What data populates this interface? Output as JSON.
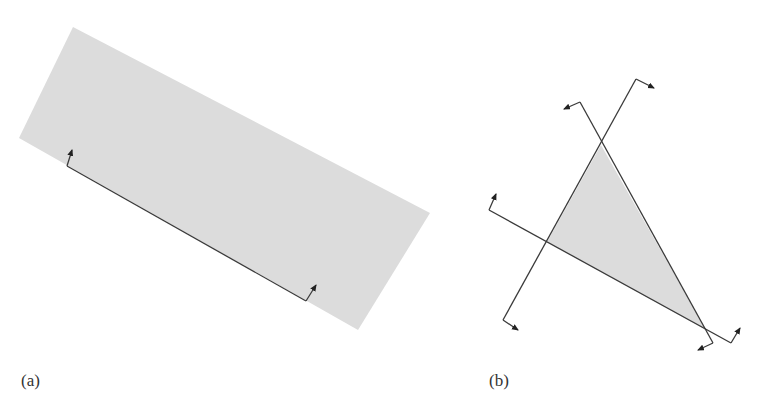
{
  "figure": {
    "panels": [
      {
        "id": "a",
        "label": "(a)",
        "description": "Gray half-plane strip (rotated rectangle) with a boundary line segment and two normal arrows pointing into the shaded region",
        "shaded_region": {
          "shape": "parallelogram",
          "fill": "#dcdcdc",
          "vertices": [
            [
              73,
              27
            ],
            [
              430,
              213
            ],
            [
              358,
              330
            ],
            [
              19,
              138
            ]
          ]
        },
        "boundary_line": {
          "from": [
            67,
            166
          ],
          "to": [
            306,
            301
          ],
          "stroke": "#333333"
        },
        "arrows": [
          {
            "from": [
              67,
              166
            ],
            "to": [
              72,
              150
            ]
          },
          {
            "from": [
              306,
              301
            ],
            "to": [
              316,
              285
            ]
          }
        ]
      },
      {
        "id": "b",
        "label": "(b)",
        "description": "Triangle formed by intersection of three half-planes; each boundary line has normal arrows at both ends",
        "shaded_region": {
          "shape": "triangle",
          "fill": "#dcdcdc",
          "vertices": [
            [
              601,
              145
            ],
            [
              706,
              330
            ],
            [
              547,
              242
            ]
          ]
        },
        "lines": [
          {
            "name": "line-1",
            "from": [
              503,
              320
            ],
            "to": [
              636,
              79
            ],
            "arrows": [
              {
                "from": [
                  503,
                  320
                ],
                "to": [
                  518,
                  330
                ]
              },
              {
                "from": [
                  636,
                  79
                ],
                "to": [
                  654,
                  88
                ]
              }
            ]
          },
          {
            "name": "line-2",
            "from": [
              580,
              102
            ],
            "to": [
              713,
              343
            ],
            "arrows": [
              {
                "from": [
                  580,
                  102
                ],
                "to": [
                  564,
                  109
                ]
              },
              {
                "from": [
                  713,
                  343
                ],
                "to": [
                  698,
                  350
                ]
              }
            ]
          },
          {
            "name": "line-3",
            "from": [
              489,
              210
            ],
            "to": [
              731,
              343
            ],
            "arrows": [
              {
                "from": [
                  489,
                  210
                ],
                "to": [
                  496,
                  194
                ]
              },
              {
                "from": [
                  731,
                  343
                ],
                "to": [
                  740,
                  328
                ]
              }
            ]
          }
        ]
      }
    ],
    "colors": {
      "region_fill": "#dcdcdc",
      "stroke": "#3a3a3a",
      "background": "#ffffff"
    }
  }
}
